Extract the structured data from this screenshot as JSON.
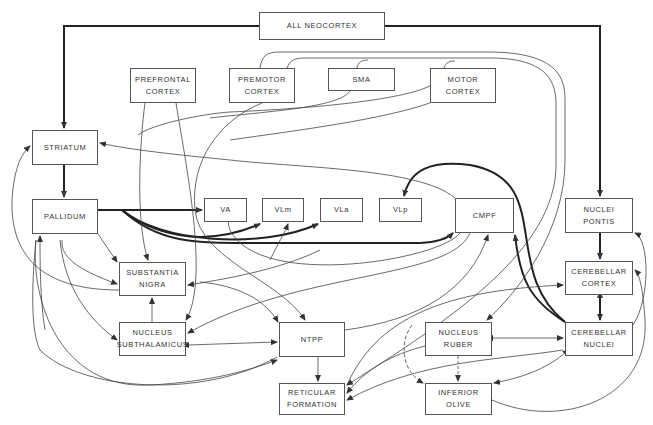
{
  "diagram": {
    "type": "neuroanatomical-connectivity-diagram",
    "colors": {
      "line": "#444444",
      "box_border": "#555555",
      "text": "#333333",
      "background": "#ffffff"
    },
    "nodes": [
      {
        "id": "neocortex",
        "lines": [
          "ALL NEOCORTEX"
        ],
        "x": 259,
        "y": 12,
        "w": 126,
        "h": 28
      },
      {
        "id": "prefrontal",
        "lines": [
          "PREFRONTAL",
          "CORTEX"
        ],
        "x": 130,
        "y": 68,
        "w": 66,
        "h": 35
      },
      {
        "id": "premotor",
        "lines": [
          "PREMOTOR",
          "CORTEX"
        ],
        "x": 229,
        "y": 68,
        "w": 66,
        "h": 35
      },
      {
        "id": "sma",
        "lines": [
          "SMA"
        ],
        "x": 328,
        "y": 68,
        "w": 67,
        "h": 23
      },
      {
        "id": "motor",
        "lines": [
          "MOTOR",
          "CORTEX"
        ],
        "x": 430,
        "y": 68,
        "w": 66,
        "h": 35
      },
      {
        "id": "striatum",
        "lines": [
          "STRIATUM"
        ],
        "x": 32,
        "y": 130,
        "w": 66,
        "h": 35
      },
      {
        "id": "pallidum",
        "lines": [
          "PALLIDUM"
        ],
        "x": 32,
        "y": 199,
        "w": 66,
        "h": 35
      },
      {
        "id": "va",
        "lines": [
          "VA"
        ],
        "x": 204,
        "y": 198,
        "w": 43,
        "h": 24
      },
      {
        "id": "vlm",
        "lines": [
          "VLm"
        ],
        "x": 262,
        "y": 198,
        "w": 42,
        "h": 24
      },
      {
        "id": "vla",
        "lines": [
          "VLa"
        ],
        "x": 320,
        "y": 198,
        "w": 43,
        "h": 24
      },
      {
        "id": "vlp",
        "lines": [
          "VLp"
        ],
        "x": 379,
        "y": 198,
        "w": 43,
        "h": 24
      },
      {
        "id": "cmpf",
        "lines": [
          "CMPF"
        ],
        "x": 455,
        "y": 198,
        "w": 59,
        "h": 35
      },
      {
        "id": "pontis",
        "lines": [
          "NUCLEI",
          "PONTIS"
        ],
        "x": 565,
        "y": 198,
        "w": 68,
        "h": 35
      },
      {
        "id": "nigra",
        "lines": [
          "SUBSTANTIA",
          "NIGRA"
        ],
        "x": 119,
        "y": 262,
        "w": 67,
        "h": 34
      },
      {
        "id": "cbcortex",
        "lines": [
          "CEREBELLAR",
          "CORTEX"
        ],
        "x": 565,
        "y": 261,
        "w": 68,
        "h": 34
      },
      {
        "id": "subthal",
        "lines": [
          "NUCLEUS",
          "SUBTHALAMICUS"
        ],
        "x": 119,
        "y": 322,
        "w": 67,
        "h": 34
      },
      {
        "id": "ntpp",
        "lines": [
          "NTPP"
        ],
        "x": 279,
        "y": 322,
        "w": 66,
        "h": 35
      },
      {
        "id": "ruber",
        "lines": [
          "NUCLEUS",
          "RUBER"
        ],
        "x": 425,
        "y": 322,
        "w": 67,
        "h": 34
      },
      {
        "id": "cbnuclei",
        "lines": [
          "CEREBELLAR",
          "NUCLEI"
        ],
        "x": 565,
        "y": 322,
        "w": 68,
        "h": 34
      },
      {
        "id": "reticular",
        "lines": [
          "RETICULAR",
          "FORMATION"
        ],
        "x": 279,
        "y": 383,
        "w": 66,
        "h": 32
      },
      {
        "id": "olive",
        "lines": [
          "INFERIOR",
          "OLIVE"
        ],
        "x": 425,
        "y": 383,
        "w": 67,
        "h": 32
      }
    ],
    "thick_edges": [
      {
        "from": "neocortex",
        "to": "striatum"
      },
      {
        "from": "neocortex",
        "to": "pontis"
      },
      {
        "from": "striatum",
        "to": "pallidum"
      },
      {
        "from": "pallidum",
        "to": "va"
      },
      {
        "from": "pallidum",
        "to": "vlm"
      },
      {
        "from": "pallidum",
        "to": "vla"
      },
      {
        "from": "pallidum",
        "to": "cmpf"
      },
      {
        "from": "pontis",
        "to": "cbcortex"
      },
      {
        "from": "cbcortex",
        "to": "cbnuclei",
        "bidirectional": true
      },
      {
        "from": "cbnuclei",
        "to": "vlp"
      },
      {
        "from": "cbnuclei",
        "to": "cmpf"
      }
    ],
    "thin_edges": [
      {
        "from": "cortex",
        "to": "striatum"
      },
      {
        "from": "prefrontal",
        "to": "nigra"
      },
      {
        "from": "prefrontal",
        "to": "subthal"
      },
      {
        "from": "premotor",
        "to": "ntpp"
      },
      {
        "from": "motor",
        "to": "ruber"
      },
      {
        "from": "motor",
        "to": "reticular"
      },
      {
        "from": "pallidum",
        "to": "nigra"
      },
      {
        "from": "pallidum",
        "to": "subthal"
      },
      {
        "from": "nigra",
        "to": "pallidum"
      },
      {
        "from": "nigra",
        "to": "striatum"
      },
      {
        "from": "nigra",
        "to": "ntpp"
      },
      {
        "from": "subthal",
        "to": "nigra"
      },
      {
        "from": "subthal",
        "to": "pallidum"
      },
      {
        "from": "subthal",
        "to": "ntpp",
        "bidirectional": true
      },
      {
        "from": "ntpp",
        "to": "pallidum"
      },
      {
        "from": "ntpp",
        "to": "reticular"
      },
      {
        "from": "cmpf",
        "to": "subthal"
      },
      {
        "from": "cmpf",
        "to": "reticular"
      },
      {
        "from": "ruber",
        "to": "cbnuclei",
        "bidirectional": true
      },
      {
        "from": "ruber",
        "to": "reticular"
      },
      {
        "from": "ruber",
        "to": "olive"
      },
      {
        "from": "cbnuclei",
        "to": "reticular"
      },
      {
        "from": "cbnuclei",
        "to": "olive",
        "bidirectional": true
      },
      {
        "from": "olive",
        "to": "cbcortex"
      },
      {
        "from": "cbnuclei",
        "to": "pontis"
      },
      {
        "from": "reticular",
        "to": "cbcortex"
      }
    ]
  }
}
